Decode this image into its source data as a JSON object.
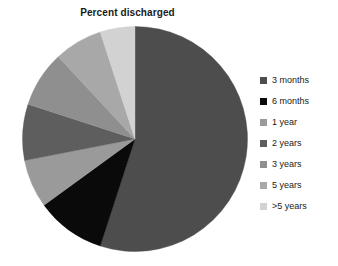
{
  "chart_data": {
    "type": "pie",
    "title": "Percent discharged",
    "xlabel": "",
    "ylabel": "",
    "legend_position": "right",
    "grid": false,
    "categories": [
      "3 months",
      "6 months",
      "1 year",
      "2 years",
      "3 years",
      "5 years",
      ">5 years"
    ],
    "values": [
      55,
      10,
      7,
      8,
      8,
      7,
      5
    ],
    "unit": "percent",
    "start_angle_deg": 0,
    "direction": "clockwise",
    "colors": [
      "#4d4d4d",
      "#0a0a0a",
      "#9a9a9a",
      "#5e5e5e",
      "#8f8f8f",
      "#a8a8a8",
      "#d2d2d2"
    ],
    "slices": [
      {
        "label": "3 months",
        "value": 55,
        "color": "#4d4d4d",
        "start_deg": 0,
        "end_deg": 198
      },
      {
        "label": "6 months",
        "value": 10,
        "color": "#0a0a0a",
        "start_deg": 198,
        "end_deg": 234
      },
      {
        "label": "1 year",
        "value": 7,
        "color": "#9a9a9a",
        "start_deg": 234,
        "end_deg": 259
      },
      {
        "label": "2 years",
        "value": 8,
        "color": "#5e5e5e",
        "start_deg": 259,
        "end_deg": 288
      },
      {
        "label": "3 years",
        "value": 8,
        "color": "#8f8f8f",
        "start_deg": 288,
        "end_deg": 317
      },
      {
        "label": "5 years",
        "value": 7,
        "color": "#a8a8a8",
        "start_deg": 317,
        "end_deg": 342
      },
      {
        "label": ">5 years",
        "value": 5,
        "color": "#d2d2d2",
        "start_deg": 342,
        "end_deg": 360
      }
    ]
  },
  "legend": {
    "items": [
      {
        "label": "3 months",
        "color": "#4d4d4d"
      },
      {
        "label": "6 months",
        "color": "#0a0a0a"
      },
      {
        "label": "1 year",
        "color": "#9a9a9a"
      },
      {
        "label": "2 years",
        "color": "#5e5e5e"
      },
      {
        "label": "3 years",
        "color": "#8f8f8f"
      },
      {
        "label": "5 years",
        "color": "#a8a8a8"
      },
      {
        "label": ">5 years",
        "color": "#d2d2d2"
      }
    ]
  },
  "style": {
    "background": "#ffffff",
    "text_color": "#1a1a1a"
  }
}
